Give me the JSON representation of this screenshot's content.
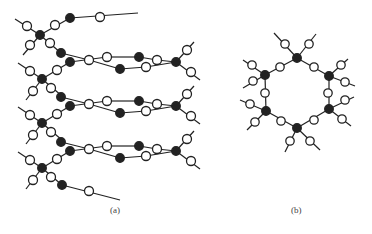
{
  "figure": {
    "panel_a_label": "(a)",
    "panel_b_label": "(b)",
    "colors": {
      "stroke": "#222222",
      "filled": "#222222",
      "open": "#ffffff"
    }
  },
  "panel_a": {
    "bands": [
      {
        "dy": 0
      },
      {
        "dy": 44
      },
      {
        "dy": 89
      }
    ]
  },
  "panel_b": {
    "ring_vertices": 6,
    "center": [
      297,
      93
    ]
  }
}
